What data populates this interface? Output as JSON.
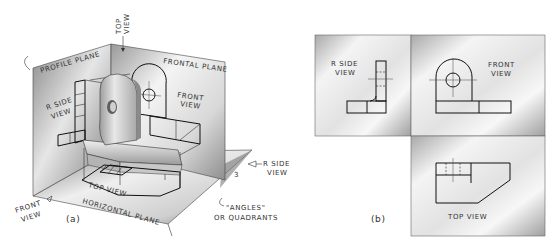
{
  "figure_a": {
    "caption": "(a)",
    "planes": {
      "profile": "PROFILE PLANE",
      "frontal": "FRONTAL PLANE",
      "horizontal": "HORIZONTAL PLANE"
    },
    "views": {
      "top_arrow_line1": "TOP",
      "top_arrow_line2": "VIEW",
      "r_side_line1": "R SIDE",
      "r_side_line2": "VIEW",
      "front_line1": "FRONT",
      "front_line2": "VIEW",
      "top_view_on_plane": "TOP VIEW",
      "r_side_arrow_line1": "R SIDE",
      "r_side_arrow_line2": "VIEW",
      "front_arrow_line1": "FRONT",
      "front_arrow_line2": "VIEW"
    },
    "quadrant_number": "3",
    "angles_note_line1": "\"ANGLES\"",
    "angles_note_line2": "OR QUADRANTS"
  },
  "figure_b": {
    "caption": "(b)",
    "r_side_line1": "R SIDE",
    "r_side_line2": "VIEW",
    "front_line1": "FRONT",
    "front_line2": "VIEW",
    "top_view": "TOP VIEW"
  },
  "colors": {
    "line": "#111111",
    "plane_dark": "#6e6e6e",
    "plane_light": "#f2f2f2",
    "background": "#ffffff"
  }
}
